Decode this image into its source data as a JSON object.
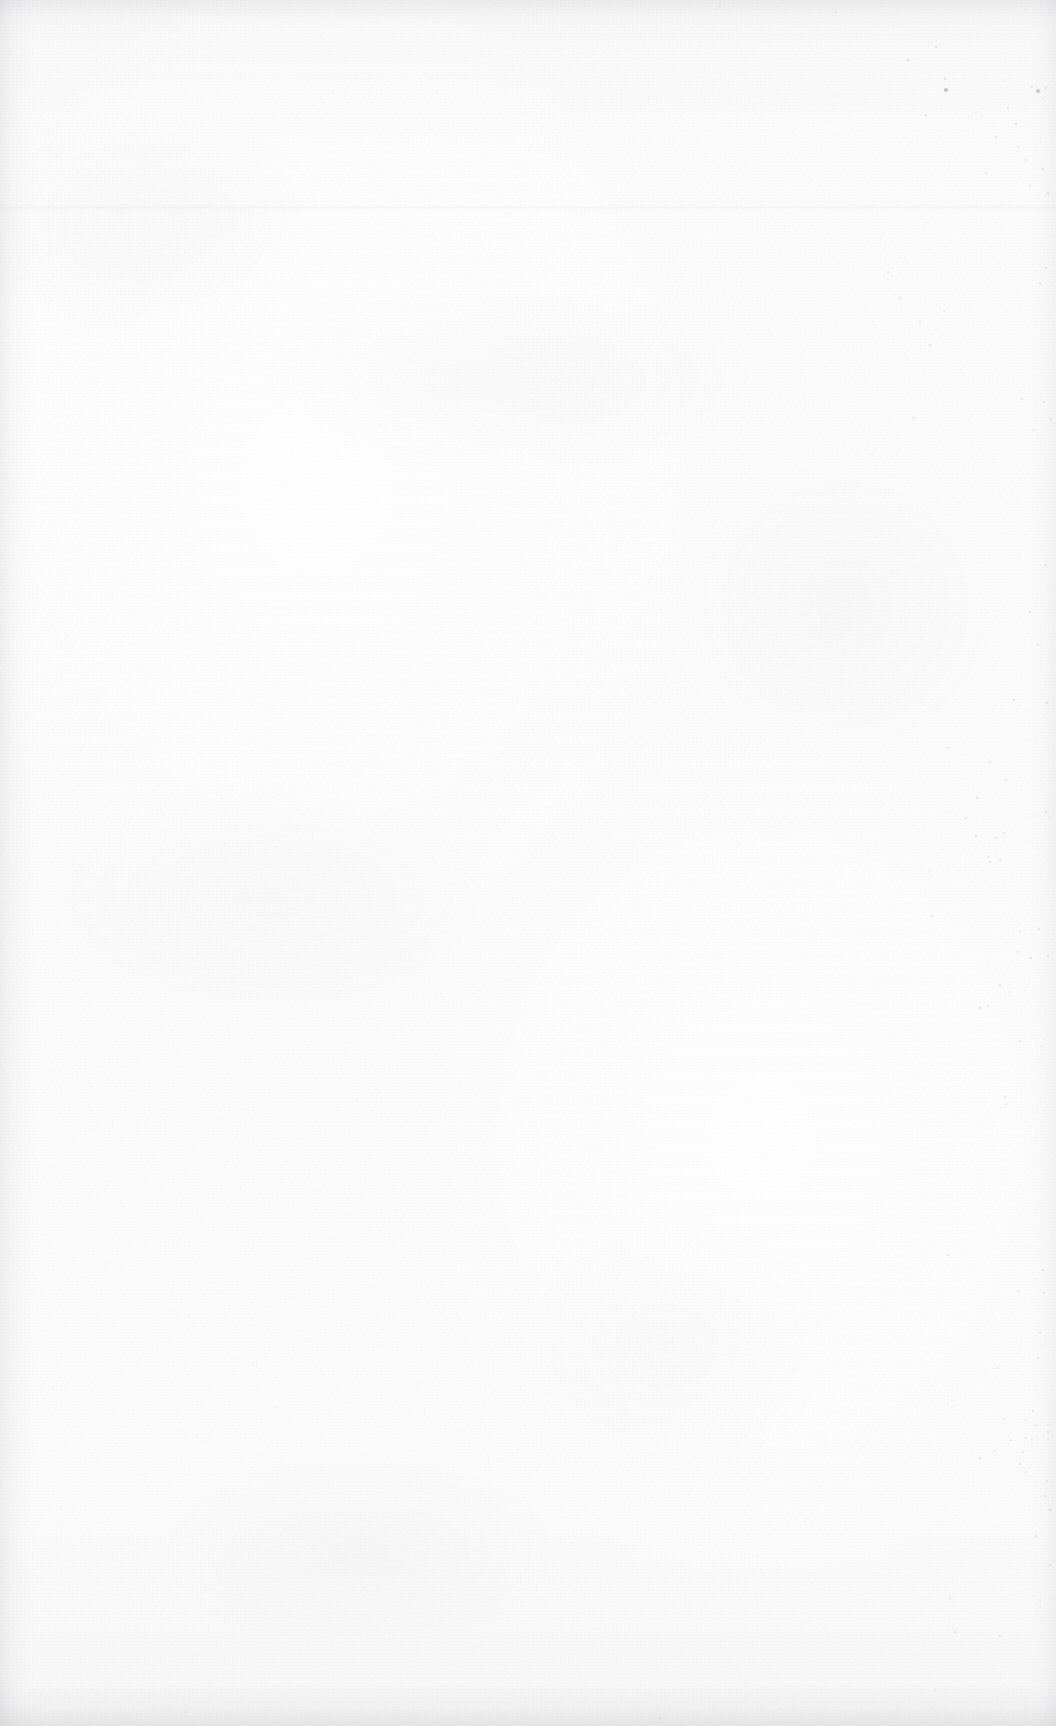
{
  "page": {
    "kind": "scanned-blank-page",
    "label": "Blank page",
    "width": 1056,
    "height": 1726,
    "text_content": "",
    "visible_text_blocks": [],
    "background_color": "#fbfbfb",
    "paper_tone": "#fbfbfb",
    "ink_color": "#7e7e88",
    "edge_shadow_color": "#8a8a92"
  },
  "artifacts": {
    "scan_seam": {
      "name": "horizontal-scan-seam",
      "y": 205,
      "height": 5,
      "opacity": 0.055
    },
    "edges": [
      {
        "name": "left-edge-shadow",
        "side": "left",
        "size": 34
      },
      {
        "name": "top-edge-shadow",
        "side": "top",
        "size": 30
      },
      {
        "name": "right-edge-shadow",
        "side": "right",
        "size": 26
      },
      {
        "name": "bottom-edge-shadow",
        "side": "bottom",
        "size": 44
      }
    ],
    "speck_note": "foxing and scanner dust, concentrated toward right margin",
    "specks": [
      {
        "x": 908,
        "y": 60,
        "r": 1.4,
        "o": 0.34
      },
      {
        "x": 936,
        "y": 47,
        "r": 1.1,
        "o": 0.26
      },
      {
        "x": 945,
        "y": 79,
        "r": 1.3,
        "o": 0.3
      },
      {
        "x": 946,
        "y": 90,
        "r": 1.8,
        "o": 0.42
      },
      {
        "x": 926,
        "y": 115,
        "r": 1.0,
        "o": 0.22
      },
      {
        "x": 1032,
        "y": 87,
        "r": 1.2,
        "o": 0.28
      },
      {
        "x": 1038,
        "y": 91,
        "r": 1.6,
        "o": 0.36
      },
      {
        "x": 1046,
        "y": 88,
        "r": 1.1,
        "o": 0.24
      },
      {
        "x": 1043,
        "y": 98,
        "r": 1.0,
        "o": 0.22
      },
      {
        "x": 1008,
        "y": 108,
        "r": 0.9,
        "o": 0.2
      },
      {
        "x": 1016,
        "y": 124,
        "r": 1.2,
        "o": 0.26
      },
      {
        "x": 1018,
        "y": 147,
        "r": 1.0,
        "o": 0.22
      },
      {
        "x": 976,
        "y": 112,
        "r": 0.9,
        "o": 0.18
      },
      {
        "x": 996,
        "y": 137,
        "r": 1.0,
        "o": 0.22
      },
      {
        "x": 986,
        "y": 173,
        "r": 1.0,
        "o": 0.24
      },
      {
        "x": 1026,
        "y": 160,
        "r": 1.1,
        "o": 0.24
      },
      {
        "x": 1043,
        "y": 169,
        "r": 1.1,
        "o": 0.26
      },
      {
        "x": 1030,
        "y": 186,
        "r": 1.0,
        "o": 0.22
      },
      {
        "x": 1048,
        "y": 193,
        "r": 1.3,
        "o": 0.28
      },
      {
        "x": 888,
        "y": 272,
        "r": 1.2,
        "o": 0.26
      },
      {
        "x": 900,
        "y": 298,
        "r": 1.1,
        "o": 0.24
      },
      {
        "x": 920,
        "y": 322,
        "r": 1.0,
        "o": 0.22
      },
      {
        "x": 930,
        "y": 345,
        "r": 1.3,
        "o": 0.28
      },
      {
        "x": 944,
        "y": 311,
        "r": 1.0,
        "o": 0.2
      },
      {
        "x": 1040,
        "y": 283,
        "r": 1.4,
        "o": 0.3
      },
      {
        "x": 1046,
        "y": 268,
        "r": 1.1,
        "o": 0.24
      },
      {
        "x": 1022,
        "y": 399,
        "r": 1.2,
        "o": 0.26
      },
      {
        "x": 1044,
        "y": 402,
        "r": 1.0,
        "o": 0.22
      },
      {
        "x": 1034,
        "y": 430,
        "r": 1.1,
        "o": 0.24
      },
      {
        "x": 914,
        "y": 418,
        "r": 1.0,
        "o": 0.2
      },
      {
        "x": 1051,
        "y": 419,
        "r": 1.3,
        "o": 0.28
      },
      {
        "x": 1046,
        "y": 565,
        "r": 1.0,
        "o": 0.22
      },
      {
        "x": 1030,
        "y": 612,
        "r": 1.1,
        "o": 0.22
      },
      {
        "x": 1038,
        "y": 645,
        "r": 1.0,
        "o": 0.2
      },
      {
        "x": 1014,
        "y": 700,
        "r": 1.0,
        "o": 0.2
      },
      {
        "x": 1047,
        "y": 703,
        "r": 1.1,
        "o": 0.24
      },
      {
        "x": 948,
        "y": 748,
        "r": 1.0,
        "o": 0.2
      },
      {
        "x": 990,
        "y": 762,
        "r": 1.0,
        "o": 0.2
      },
      {
        "x": 1006,
        "y": 780,
        "r": 0.9,
        "o": 0.18
      },
      {
        "x": 977,
        "y": 798,
        "r": 1.1,
        "o": 0.22
      },
      {
        "x": 1046,
        "y": 812,
        "r": 1.2,
        "o": 0.26
      },
      {
        "x": 1050,
        "y": 818,
        "r": 1.0,
        "o": 0.22
      },
      {
        "x": 966,
        "y": 818,
        "r": 1.1,
        "o": 0.24
      },
      {
        "x": 976,
        "y": 836,
        "r": 1.3,
        "o": 0.28
      },
      {
        "x": 996,
        "y": 838,
        "r": 1.0,
        "o": 0.22
      },
      {
        "x": 1004,
        "y": 833,
        "r": 1.1,
        "o": 0.22
      },
      {
        "x": 988,
        "y": 857,
        "r": 0.9,
        "o": 0.18
      },
      {
        "x": 990,
        "y": 862,
        "r": 1.2,
        "o": 0.26
      },
      {
        "x": 1000,
        "y": 860,
        "r": 0.9,
        "o": 0.18
      },
      {
        "x": 930,
        "y": 870,
        "r": 1.0,
        "o": 0.2
      },
      {
        "x": 1039,
        "y": 929,
        "r": 1.0,
        "o": 0.2
      },
      {
        "x": 932,
        "y": 916,
        "r": 1.1,
        "o": 0.22
      },
      {
        "x": 1020,
        "y": 931,
        "r": 0.9,
        "o": 0.18
      },
      {
        "x": 1018,
        "y": 952,
        "r": 1.0,
        "o": 0.2
      },
      {
        "x": 1031,
        "y": 958,
        "r": 1.2,
        "o": 0.26
      },
      {
        "x": 1048,
        "y": 956,
        "r": 1.0,
        "o": 0.22
      },
      {
        "x": 1000,
        "y": 985,
        "r": 1.1,
        "o": 0.24
      },
      {
        "x": 1010,
        "y": 992,
        "r": 1.0,
        "o": 0.2
      },
      {
        "x": 980,
        "y": 1008,
        "r": 1.2,
        "o": 0.26
      },
      {
        "x": 988,
        "y": 1006,
        "r": 1.0,
        "o": 0.2
      },
      {
        "x": 1020,
        "y": 1041,
        "r": 1.0,
        "o": 0.2
      },
      {
        "x": 1042,
        "y": 1046,
        "r": 1.1,
        "o": 0.22
      },
      {
        "x": 1005,
        "y": 1097,
        "r": 1.0,
        "o": 0.2
      },
      {
        "x": 1007,
        "y": 1104,
        "r": 0.9,
        "o": 0.18
      },
      {
        "x": 948,
        "y": 1255,
        "r": 1.2,
        "o": 0.26
      },
      {
        "x": 1043,
        "y": 1270,
        "r": 1.3,
        "o": 0.28
      },
      {
        "x": 1019,
        "y": 1291,
        "r": 1.0,
        "o": 0.22
      },
      {
        "x": 1044,
        "y": 1293,
        "r": 1.0,
        "o": 0.2
      },
      {
        "x": 1040,
        "y": 1333,
        "r": 1.0,
        "o": 0.2
      },
      {
        "x": 1038,
        "y": 1358,
        "r": 1.0,
        "o": 0.2
      },
      {
        "x": 998,
        "y": 1368,
        "r": 1.1,
        "o": 0.24
      },
      {
        "x": 952,
        "y": 1400,
        "r": 1.0,
        "o": 0.22
      },
      {
        "x": 1036,
        "y": 1425,
        "r": 1.0,
        "o": 0.2
      },
      {
        "x": 1026,
        "y": 1420,
        "r": 0.9,
        "o": 0.18
      },
      {
        "x": 1004,
        "y": 1419,
        "r": 1.0,
        "o": 0.2
      },
      {
        "x": 1032,
        "y": 1440,
        "r": 1.1,
        "o": 0.24
      },
      {
        "x": 1033,
        "y": 1411,
        "r": 1.2,
        "o": 0.26
      },
      {
        "x": 1023,
        "y": 1452,
        "r": 1.0,
        "o": 0.2
      },
      {
        "x": 1011,
        "y": 1440,
        "r": 1.0,
        "o": 0.2
      },
      {
        "x": 1026,
        "y": 1438,
        "r": 1.0,
        "o": 0.2
      },
      {
        "x": 995,
        "y": 1451,
        "r": 1.0,
        "o": 0.2
      },
      {
        "x": 1020,
        "y": 1464,
        "r": 0.9,
        "o": 0.18
      },
      {
        "x": 980,
        "y": 1458,
        "r": 1.0,
        "o": 0.2
      },
      {
        "x": 1026,
        "y": 1472,
        "r": 1.0,
        "o": 0.2
      },
      {
        "x": 1048,
        "y": 1432,
        "r": 1.2,
        "o": 0.26
      },
      {
        "x": 1047,
        "y": 1481,
        "r": 1.1,
        "o": 0.24
      },
      {
        "x": 1045,
        "y": 1496,
        "r": 1.0,
        "o": 0.2
      },
      {
        "x": 1050,
        "y": 1510,
        "r": 1.4,
        "o": 0.32
      },
      {
        "x": 1036,
        "y": 1536,
        "r": 1.0,
        "o": 0.2
      },
      {
        "x": 1050,
        "y": 1565,
        "r": 1.1,
        "o": 0.24
      },
      {
        "x": 950,
        "y": 1598,
        "r": 1.1,
        "o": 0.24
      },
      {
        "x": 1040,
        "y": 1600,
        "r": 1.0,
        "o": 0.2
      },
      {
        "x": 955,
        "y": 1632,
        "r": 1.0,
        "o": 0.2
      },
      {
        "x": 1000,
        "y": 1636,
        "r": 1.0,
        "o": 0.2
      },
      {
        "x": 935,
        "y": 1690,
        "r": 1.0,
        "o": 0.2
      },
      {
        "x": 720,
        "y": 6,
        "r": 0.9,
        "o": 0.18
      },
      {
        "x": 836,
        "y": 12,
        "r": 0.9,
        "o": 0.16
      },
      {
        "x": 660,
        "y": 1718,
        "r": 0.9,
        "o": 0.16
      },
      {
        "x": 186,
        "y": 1712,
        "r": 0.9,
        "o": 0.16
      }
    ]
  }
}
